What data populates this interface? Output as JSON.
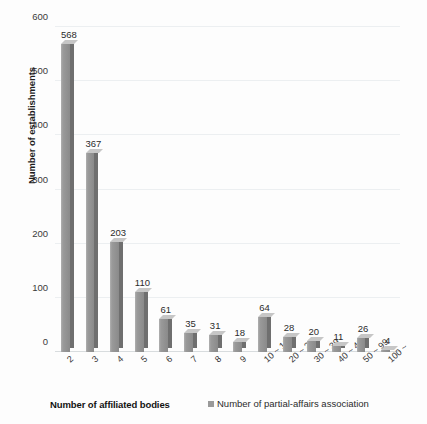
{
  "chart_data": {
    "type": "bar",
    "title": "",
    "xlabel": "Number of affiliated bodies",
    "ylabel": "Number of establishments",
    "categories": [
      "2",
      "3",
      "4",
      "5",
      "6",
      "7",
      "8",
      "9",
      "10 ~ 19",
      "20 ~ 29",
      "30 ~ 39",
      "40 ~ 49",
      "50 ~ 99",
      "100 ~"
    ],
    "values": [
      568,
      367,
      203,
      110,
      61,
      35,
      31,
      18,
      64,
      28,
      20,
      11,
      26,
      4
    ],
    "series": [
      {
        "name": "Number of partial-affairs association",
        "values": [
          568,
          367,
          203,
          110,
          61,
          35,
          31,
          18,
          64,
          28,
          20,
          11,
          26,
          4
        ]
      }
    ],
    "ylim": [
      0,
      600
    ],
    "yticks": [
      0,
      100,
      200,
      300,
      400,
      500,
      600
    ],
    "ytick_labels": [
      "0",
      "100",
      "200",
      "300",
      "400",
      "500",
      "600"
    ],
    "grid": true,
    "legend_position": "bottom",
    "bar_color": "#929292",
    "bar_side_color": "#6f6f6f",
    "bar_top_color": "#c6c6c6",
    "gridline_color": "#eceff1",
    "text_color": "#2b2b2b"
  },
  "legend": {
    "entries": [
      {
        "label": "Number of partial-affairs association",
        "color": "#9a9a9a"
      }
    ]
  },
  "axes": {
    "x_title": "Number of affiliated bodies",
    "y_title": "Number of establishments"
  }
}
